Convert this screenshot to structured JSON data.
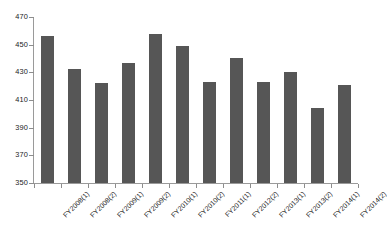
{
  "chart_data": {
    "type": "bar",
    "title": "",
    "xlabel": "",
    "ylabel": "",
    "ylim": [
      350,
      470
    ],
    "ytick_step": 20,
    "grid": false,
    "legend": false,
    "bar_color": "#565656",
    "axis_color": "#8d8d8d",
    "yticks": [
      470,
      450,
      430,
      410,
      390,
      370,
      350
    ],
    "categories": [
      "FY2008(1)",
      "FY2008(2)",
      "FY2009(1)",
      "FY2009(2)",
      "FY2010(1)",
      "FY2010(2)",
      "FY2011(1)",
      "FY2012(2)",
      "FY2013(1)",
      "FY2013(2)",
      "FY2014(1)",
      "FY2014(2)"
    ],
    "values": [
      456,
      432.5,
      422,
      437,
      458,
      449,
      423,
      440.5,
      423,
      430.5,
      404.5,
      420.5
    ]
  }
}
